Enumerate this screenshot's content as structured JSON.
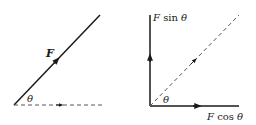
{
  "left_diagram": {
    "force_label": "F",
    "angle_label": "θ"
  },
  "right_diagram": {
    "vertical_component_label": {
      "prefix": "F",
      "func": " sin ",
      "angle": "θ"
    },
    "horizontal_component_label": {
      "prefix": "F",
      "func": " cos ",
      "angle": "θ"
    },
    "angle_label": "θ"
  },
  "colors": {
    "stroke": "#1a1a1a",
    "dashed": "#555555"
  }
}
